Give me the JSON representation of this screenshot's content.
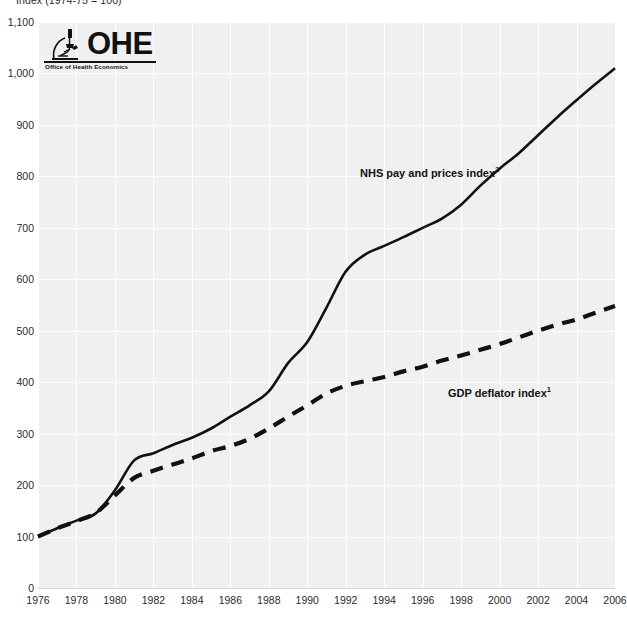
{
  "axis_caption": "Index (1974-75 = 100)",
  "logo": {
    "name": "OHE",
    "wordmark": "OHE",
    "tagline": "Office of Health Economics",
    "mark": "microscope-icon"
  },
  "chart_data": {
    "type": "line",
    "title": "",
    "subtitle": "",
    "xlabel": "",
    "ylabel": "Index (1974-75 = 100)",
    "xlim": [
      1976,
      2006
    ],
    "ylim": [
      0,
      1100
    ],
    "grid": true,
    "legend_position": "inline-annotation",
    "plot_background": "#f0f0f0",
    "gridline_color": "#ffffff",
    "y_ticks": [
      0,
      100,
      200,
      300,
      400,
      500,
      600,
      700,
      800,
      900,
      1000,
      1100
    ],
    "y_tick_labels": [
      "0",
      "100",
      "200",
      "300",
      "400",
      "500",
      "600",
      "700",
      "800",
      "900",
      "1,000",
      "1,100"
    ],
    "x_ticks": [
      1976,
      1978,
      1980,
      1982,
      1984,
      1986,
      1988,
      1990,
      1992,
      1994,
      1996,
      1998,
      2000,
      2002,
      2004,
      2006
    ],
    "x_tick_labels": [
      "1976",
      "1978",
      "1980",
      "1982",
      "1984",
      "1986",
      "1988",
      "1990",
      "1992",
      "1994",
      "1996",
      "1998",
      "2000",
      "2002",
      "2004",
      "2006"
    ],
    "x": [
      1976,
      1977,
      1978,
      1979,
      1980,
      1981,
      1982,
      1983,
      1984,
      1985,
      1986,
      1987,
      1988,
      1989,
      1990,
      1991,
      1992,
      1993,
      1994,
      1995,
      1996,
      1997,
      1998,
      1999,
      2000,
      2001,
      2002,
      2003,
      2004,
      2005,
      2006
    ],
    "series": [
      {
        "name": "NHS pay and prices index",
        "label": "NHS pay and prices index",
        "label_superscript": "2",
        "style": "solid",
        "color": "#111111",
        "width": 2.6,
        "values": [
          100,
          116,
          131,
          145,
          190,
          248,
          262,
          278,
          292,
          310,
          333,
          355,
          382,
          437,
          478,
          545,
          615,
          648,
          665,
          682,
          700,
          718,
          745,
          782,
          815,
          845,
          880,
          915,
          948,
          980,
          1010
        ]
      },
      {
        "name": "GDP deflator index",
        "label": "GDP deflator index",
        "label_superscript": "1",
        "style": "dashed",
        "color": "#111111",
        "width": 4.2,
        "values": [
          100,
          116,
          130,
          146,
          180,
          214,
          228,
          240,
          252,
          266,
          276,
          290,
          310,
          333,
          355,
          378,
          393,
          402,
          410,
          421,
          430,
          442,
          452,
          463,
          474,
          487,
          500,
          512,
          522,
          535,
          548
        ]
      }
    ]
  }
}
